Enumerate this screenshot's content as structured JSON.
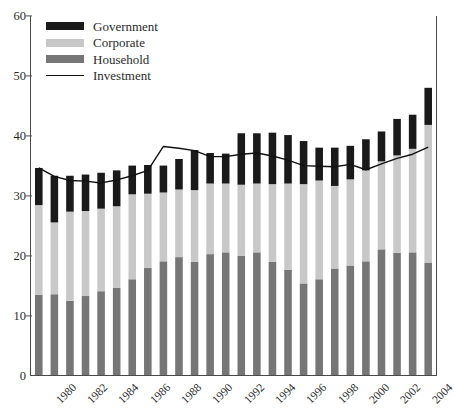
{
  "chart_data": {
    "type": "bar",
    "stacked": true,
    "title": "",
    "xlabel": "",
    "ylabel": "",
    "ylim": [
      0,
      60
    ],
    "yticks": [
      0,
      10,
      20,
      30,
      40,
      50,
      60
    ],
    "grid": false,
    "legend_position": "top-left",
    "x": [
      1980,
      1981,
      1982,
      1983,
      1984,
      1985,
      1986,
      1987,
      1988,
      1989,
      1990,
      1991,
      1992,
      1993,
      1994,
      1995,
      1996,
      1997,
      1998,
      1999,
      2000,
      2001,
      2002,
      2003,
      2004,
      2005
    ],
    "xtick_labels": [
      "1980",
      "1982",
      "1984",
      "1986",
      "1988",
      "1990",
      "1992",
      "1994",
      "1996",
      "1998",
      "2000",
      "2002",
      "2004"
    ],
    "categories": [
      "1980",
      "1981",
      "1982",
      "1983",
      "1984",
      "1985",
      "1986",
      "1987",
      "1988",
      "1989",
      "1990",
      "1991",
      "1992",
      "1993",
      "1994",
      "1995",
      "1996",
      "1997",
      "1998",
      "1999",
      "2000",
      "2001",
      "2002",
      "2003",
      "2004",
      "2005"
    ],
    "series": [
      {
        "name": "Household",
        "color": "#767676",
        "values": [
          13.4,
          13.5,
          12.4,
          13.2,
          14.0,
          14.6,
          16.0,
          17.9,
          19.0,
          19.7,
          18.9,
          20.2,
          20.5,
          19.9,
          20.5,
          18.9,
          17.6,
          15.3,
          16.0,
          17.8,
          18.3,
          19.0,
          21.0,
          20.4,
          20.5,
          18.8
        ]
      },
      {
        "name": "Corporate",
        "color": "#c8c8c8",
        "values": [
          15.0,
          12.0,
          14.9,
          14.2,
          13.8,
          13.6,
          14.2,
          12.4,
          11.5,
          11.3,
          12.0,
          11.8,
          11.5,
          11.9,
          11.5,
          13.0,
          14.4,
          16.6,
          16.5,
          13.8,
          14.4,
          15.2,
          14.7,
          16.3,
          17.3,
          23.0
        ]
      },
      {
        "name": "Government",
        "color": "#1a1a1a",
        "values": [
          6.2,
          7.8,
          6.0,
          6.1,
          6.0,
          6.0,
          4.8,
          4.8,
          4.5,
          5.1,
          6.7,
          5.1,
          5.0,
          8.6,
          8.4,
          8.6,
          8.1,
          7.2,
          5.5,
          6.4,
          5.6,
          5.2,
          5.0,
          6.1,
          5.7,
          6.2
        ]
      }
    ],
    "overlay_line": {
      "name": "Investment",
      "color": "#111111",
      "values": [
        34.6,
        33.2,
        32.5,
        32.4,
        32.1,
        32.6,
        33.3,
        34.2,
        38.2,
        37.9,
        37.5,
        36.5,
        36.5,
        36.9,
        37.1,
        36.6,
        35.9,
        35.0,
        34.9,
        34.8,
        35.2,
        34.3,
        35.3,
        36.2,
        36.9,
        38.1
      ]
    }
  },
  "legend": {
    "items": [
      {
        "label": "Government",
        "swatch": "bar",
        "color": "#1a1a1a"
      },
      {
        "label": "Corporate",
        "swatch": "bar",
        "color": "#c8c8c8"
      },
      {
        "label": "Household",
        "swatch": "bar",
        "color": "#767676"
      },
      {
        "label": "Investment",
        "swatch": "line",
        "color": "#111111"
      }
    ]
  },
  "axes": {
    "y_tick_labels": [
      "60",
      "50",
      "40",
      "30",
      "20",
      "10",
      "0"
    ]
  }
}
